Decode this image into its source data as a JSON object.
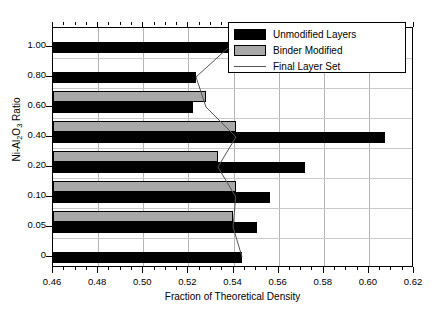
{
  "chart_data": {
    "type": "bar",
    "orientation": "horizontal",
    "title": "",
    "xlabel": "Fraction of Theoretical Density",
    "ylabel": "Ni-Al2O3 Ratio",
    "ylabel_html": "Ni-Al<sub>2</sub>O<sub>3</sub> Ratio",
    "xlim": [
      0.46,
      0.62
    ],
    "ylim_categories": [
      "0",
      "0.05",
      "0.10",
      "0.20",
      "0.40",
      "0.60",
      "0.80",
      "1.00"
    ],
    "xticks": [
      0.46,
      0.48,
      0.5,
      0.52,
      0.54,
      0.56,
      0.58,
      0.6,
      0.62
    ],
    "xtick_labels": [
      "0.46",
      "0.48",
      "0.50",
      "0.52",
      "0.54",
      "0.56",
      "0.58",
      "0.60",
      "0.62"
    ],
    "yticks": [
      "1.00",
      "0.80",
      "0.60",
      "0.40",
      "0.20",
      "0.10",
      "0.05",
      "0"
    ],
    "xminor_step": 0.005,
    "grid": "vertical",
    "legend_position": "top-right",
    "categories": [
      "1.00",
      "0.80",
      "0.60",
      "0.40",
      "0.20",
      "0.10",
      "0.05",
      "0"
    ],
    "series": [
      {
        "name": "Unmodified Layers",
        "color": "#000000",
        "values": [
          0.538,
          0.5234,
          0.522,
          0.607,
          0.5718,
          0.5563,
          0.5502,
          0.5438
        ]
      },
      {
        "name": "Binder Modified",
        "color": "#A8A8A8",
        "values": [
          null,
          null,
          0.5278,
          0.5411,
          0.5331,
          0.541,
          0.5398,
          null
        ]
      }
    ],
    "line_series": {
      "name": "Final Layer Set",
      "color": "#555555",
      "points": [
        {
          "category": "1.00",
          "value": 0.538
        },
        {
          "category": "0.80",
          "value": 0.5234
        },
        {
          "category": "0.60",
          "value": 0.5278
        },
        {
          "category": "0.40",
          "value": 0.5411
        },
        {
          "category": "0.20",
          "value": 0.5331
        },
        {
          "category": "0.10",
          "value": 0.541
        },
        {
          "category": "0.05",
          "value": 0.5398
        },
        {
          "category": "0",
          "value": 0.5438
        }
      ]
    }
  },
  "legend": {
    "items": [
      {
        "label": "Unmodified Layers",
        "swatch": "black-filled-rect"
      },
      {
        "label": "Binder Modified",
        "swatch": "gray-filled-rect"
      },
      {
        "label": "Final Layer Set",
        "swatch": "thin-line"
      }
    ]
  },
  "axes": {
    "x_title": "Fraction of Theoretical Density",
    "y_title_prefix": "Ni-Al",
    "y_title_sub1": "2",
    "y_title_mid": "O",
    "y_title_sub2": "3",
    "y_title_suffix": " Ratio"
  }
}
